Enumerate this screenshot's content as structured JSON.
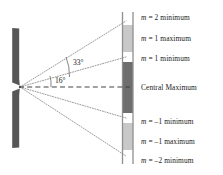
{
  "diagram": {
    "colors": {
      "barrier": "#575757",
      "screen_edge": "#8c8c8c",
      "central_band": "#6e6e6e",
      "first_order_band": "#c8c8c8",
      "minimum_band": "#ffffff",
      "ray": "#7a7a7a",
      "axis": "#3a3a3a",
      "text": "#1a1a1a",
      "background": "#ffffff"
    },
    "barrier": {
      "name": "slit-barrier",
      "x": 12,
      "width": 7,
      "top_y": 28,
      "bottom_y": 148,
      "slit_center_y": 87
    },
    "screen": {
      "name": "detection-screen",
      "x": 122,
      "width": 11,
      "top_y": 12,
      "bottom_y": 164,
      "bands": [
        {
          "id": "top-white",
          "label": "m = 2 minimum",
          "fill": "#ffffff",
          "y": 12,
          "height": 13
        },
        {
          "id": "m1-max-top",
          "label": "m = 1 maximum",
          "fill": "#c8c8c8",
          "y": 25,
          "height": 27
        },
        {
          "id": "m1-min-top",
          "label": "m = 1 minimum",
          "fill": "#ffffff",
          "y": 52,
          "height": 10
        },
        {
          "id": "central-max",
          "label": "Central Maximum",
          "fill": "#6e6e6e",
          "y": 62,
          "height": 51
        },
        {
          "id": "m1-min-bot",
          "label": "m = -1 minimum",
          "fill": "#ffffff",
          "y": 113,
          "height": 10
        },
        {
          "id": "m1-max-bot",
          "label": "m = -1 maximum",
          "fill": "#c8c8c8",
          "y": 123,
          "height": 27
        },
        {
          "id": "bottom-white",
          "label": "m = -2 minimum",
          "fill": "#ffffff",
          "y": 150,
          "height": 14
        }
      ]
    },
    "angles": [
      {
        "name": "angle-33",
        "text": "33°",
        "value": 33,
        "unit": "degrees"
      },
      {
        "name": "angle-16",
        "text": "16°",
        "value": 16,
        "unit": "degrees"
      }
    ],
    "labels": [
      {
        "name": "label-m2-minimum",
        "order": 2,
        "kind": "minimum",
        "m_symbol": "m",
        "rest": " = 2 minimum",
        "y": 17
      },
      {
        "name": "label-m1-maximum",
        "order": 1,
        "kind": "maximum",
        "m_symbol": "m",
        "rest": " = 1 maximum",
        "y": 38
      },
      {
        "name": "label-m1-minimum",
        "order": 1,
        "kind": "minimum",
        "m_symbol": "m",
        "rest": " = 1 minimum",
        "y": 58
      },
      {
        "name": "label-central-maximum",
        "order": 0,
        "kind": "maximum",
        "m_symbol": "",
        "rest": "Central Maximum",
        "y": 87
      },
      {
        "name": "label-mneg1-minimum",
        "order": -1,
        "kind": "minimum",
        "m_symbol": "m",
        "rest": " = –1 minimum",
        "y": 121
      },
      {
        "name": "label-mneg1-maximum",
        "order": -1,
        "kind": "maximum",
        "m_symbol": "m",
        "rest": " = –1 maximum",
        "y": 141
      },
      {
        "name": "label-mneg2-minimum",
        "order": -2,
        "kind": "minimum",
        "m_symbol": "m",
        "rest": " = –2 minimum",
        "y": 160
      }
    ],
    "rays": [
      {
        "name": "ray-m2-minimum-upper",
        "to_y": 22
      },
      {
        "name": "ray-m1-minimum-upper",
        "to_y": 57
      },
      {
        "name": "ray-central-axis",
        "to_y": 87
      },
      {
        "name": "ray-m1-minimum-lower",
        "to_y": 118
      },
      {
        "name": "ray-m2-minimum-lower",
        "to_y": 155
      }
    ]
  }
}
